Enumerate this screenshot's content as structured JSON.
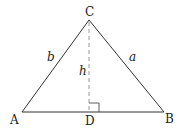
{
  "diagram": {
    "vertices": [
      {
        "id": "A",
        "label": "A",
        "x": 22,
        "y": 112
      },
      {
        "id": "B",
        "label": "B",
        "x": 164,
        "y": 112
      },
      {
        "id": "C",
        "label": "C",
        "x": 89,
        "y": 20
      },
      {
        "id": "D",
        "label": "D",
        "x": 89,
        "y": 112
      }
    ],
    "sides": [
      {
        "from": "A",
        "to": "C",
        "label": "b"
      },
      {
        "from": "C",
        "to": "B",
        "label": "a"
      },
      {
        "from": "A",
        "to": "B",
        "label": ""
      }
    ],
    "altitude": {
      "from": "C",
      "to": "D",
      "label": "h",
      "style": "dashed"
    },
    "right_angle_at": "D",
    "colors": {
      "stroke": "#333333",
      "dashed": "#888888",
      "text": "#222222"
    }
  }
}
